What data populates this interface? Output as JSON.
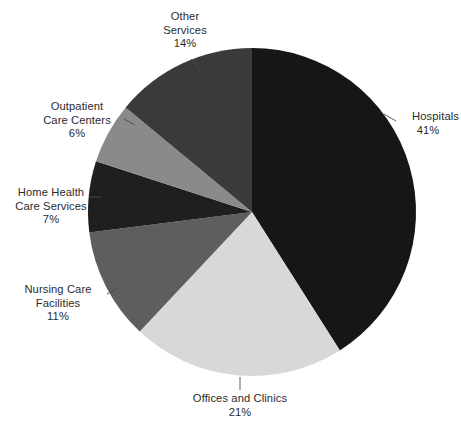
{
  "chart_data": {
    "type": "pie",
    "title": "",
    "subtitle": "",
    "xlabel": "",
    "ylabel": "",
    "legend_position": "none",
    "grid": false,
    "units": "percent",
    "start_angle_deg": 0,
    "direction": "clockwise",
    "categories": [
      "Hospitals",
      "Offices and Clinics",
      "Nursing Care Facilities",
      "Home Health Care Services",
      "Outpatient Care Centers",
      "Other Services"
    ],
    "values": [
      41,
      21,
      11,
      7,
      6,
      14
    ],
    "colors": [
      "#161616",
      "#d8d8d8",
      "#5e5e5e",
      "#1f1f1f",
      "#8a8a8a",
      "#3a3a3a"
    ],
    "slices": [
      {
        "key": "hospitals",
        "label": "Hospitals",
        "label_lines": [
          "Hospitals",
          "41%"
        ],
        "value": 41,
        "value_text": "41%",
        "color": "#161616"
      },
      {
        "key": "offices-and-clinics",
        "label": "Offices and Clinics",
        "label_lines": [
          "Offices and Clinics",
          "21%"
        ],
        "value": 21,
        "value_text": "21%",
        "color": "#d8d8d8"
      },
      {
        "key": "nursing-care-facilities",
        "label": "Nursing Care Facilities",
        "label_lines": [
          "Nursing Care",
          "Facilities",
          "11%"
        ],
        "value": 11,
        "value_text": "11%",
        "color": "#5e5e5e"
      },
      {
        "key": "home-health-care-services",
        "label": "Home Health Care Services",
        "label_lines": [
          "Home Health",
          "Care Services",
          "7%"
        ],
        "value": 7,
        "value_text": "7%",
        "color": "#1f1f1f"
      },
      {
        "key": "outpatient-care-centers",
        "label": "Outpatient Care Centers",
        "label_lines": [
          "Outpatient",
          "Care Centers",
          "6%"
        ],
        "value": 6,
        "value_text": "6%",
        "color": "#8a8a8a"
      },
      {
        "key": "other-services",
        "label": "Other Services",
        "label_lines": [
          "Other",
          "Services",
          "14%"
        ],
        "value": 14,
        "value_text": "14%",
        "color": "#3a3a3a"
      }
    ]
  },
  "labels": {
    "other_services": {
      "line1": "Other",
      "line2": "Services",
      "line3": "14%"
    },
    "hospitals": {
      "line1": "Hospitals",
      "line2": "41%"
    },
    "outpatient_care_centers": {
      "line1": "Outpatient",
      "line2": "Care Centers",
      "line3": "6%"
    },
    "home_health_care_services": {
      "line1": "Home Health",
      "line2": "Care Services",
      "line3": "7%"
    },
    "nursing_care_facilities": {
      "line1": "Nursing Care",
      "line2": "Facilities",
      "line3": "11%"
    },
    "offices_and_clinics": {
      "line1": "Offices and Clinics",
      "line2": "21%"
    }
  },
  "style": {
    "background": "#ffffff",
    "text_color": "#2b2b2b",
    "leader_line_color": "#4a4a4a"
  }
}
